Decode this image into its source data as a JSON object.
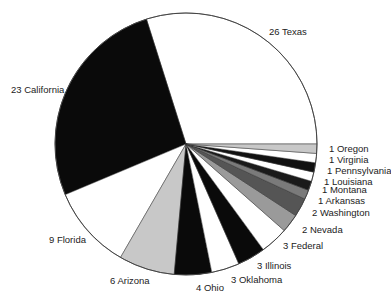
{
  "chart_data": {
    "type": "pie",
    "title": "",
    "start_angle_deg": 0,
    "direction": "counterclockwise",
    "categories": [
      "Texas",
      "California",
      "Florida",
      "Arizona",
      "Ohio",
      "Oklahoma",
      "Illinois",
      "Federal",
      "Nevada",
      "Washington",
      "Arkansas",
      "Montana",
      "Louisiana",
      "Pennsylvania",
      "Virginia",
      "Oregon"
    ],
    "values": [
      26,
      23,
      9,
      6,
      4,
      3,
      3,
      3,
      2,
      2,
      1,
      1,
      1,
      1,
      1,
      1
    ],
    "total": 88,
    "labels": [
      "26 Texas",
      "23 California",
      "9 Florida",
      "6 Arizona",
      "4 Ohio",
      "3 Oklahoma",
      "3 Illinois",
      "3 Federal",
      "2 Nevada",
      "2 Washington",
      "1 Arkansas",
      "1 Montana",
      "1 Louisiana",
      "1 Pennsylvania",
      "1 Virginia",
      "1 Oregon"
    ],
    "colors": [
      "#ffffff",
      "#0a0a0a",
      "#ffffff",
      "#c8c8c8",
      "#0a0a0a",
      "#ffffff",
      "#0a0a0a",
      "#ffffff",
      "#9a9a9a",
      "#555555",
      "#7a7a7a",
      "#1a1a1a",
      "#ffffff",
      "#111111",
      "#ffffff",
      "#c8c8c8"
    ],
    "label_positions": [
      [
        269,
        35
      ],
      [
        11,
        93
      ],
      [
        49,
        243
      ],
      [
        110,
        284
      ],
      [
        196,
        291
      ],
      [
        231,
        283
      ],
      [
        257,
        269
      ],
      [
        283,
        249
      ],
      [
        302,
        233
      ],
      [
        312,
        216
      ],
      [
        318,
        204
      ],
      [
        322,
        193
      ],
      [
        324,
        185
      ],
      [
        327,
        174
      ],
      [
        329,
        163
      ],
      [
        329,
        152
      ]
    ],
    "legend": "none",
    "grid": false
  }
}
